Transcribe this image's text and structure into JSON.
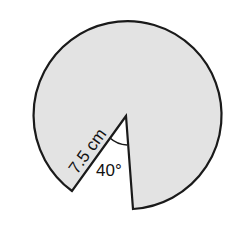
{
  "diagram": {
    "type": "circle-sector",
    "radius_label": "7.5 cm",
    "angle_label": "40°",
    "fill_color": "#e3e3e3",
    "stroke_color": "#1a1a1a"
  }
}
